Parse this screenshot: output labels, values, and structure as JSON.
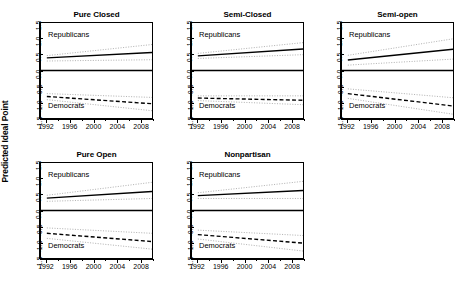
{
  "figure": {
    "ylabel": "Predicted Ideal Point",
    "annotation_republicans": "Republicans",
    "annotation_democrats": "Democrats"
  },
  "axes": {
    "ytick_labels": [
      "-1.5",
      "-1.0",
      "-0.5",
      "0.0",
      "0.5",
      "1.0",
      "1.5"
    ],
    "ytick_values": [
      -1.5,
      -1.0,
      -0.5,
      0.0,
      0.5,
      1.0,
      1.5
    ],
    "xtick_labels": [
      "1992",
      "1996",
      "2000",
      "2004",
      "2008"
    ],
    "xtick_values": [
      1992,
      1996,
      2000,
      2004,
      2008
    ],
    "xlim": [
      1991,
      2010
    ],
    "ylim": [
      -1.5,
      1.5
    ]
  },
  "colors": {
    "line": "#000000",
    "ci": "#b4b4b4",
    "zero_line": "#000000",
    "frame": "#000000",
    "background": "#ffffff"
  },
  "chart_data": {
    "type": "line",
    "title": "",
    "xlabel": "",
    "ylabel": "Predicted Ideal Point",
    "xlim": [
      1991,
      2010
    ],
    "ylim": [
      -1.5,
      1.5
    ],
    "grid": false,
    "legend_position": "none",
    "x": [
      1992,
      2010
    ],
    "panels": [
      {
        "title": "Pure Closed",
        "row": 0,
        "col": 0,
        "series": [
          {
            "name": "Republicans",
            "style": "solid",
            "values": [
              0.4,
              0.57
            ]
          },
          {
            "name": "Republicans CI upper",
            "style": "dotted",
            "values": [
              0.47,
              0.82
            ]
          },
          {
            "name": "Republicans CI lower",
            "style": "dotted",
            "values": [
              0.3,
              0.34
            ]
          },
          {
            "name": "Democrats",
            "style": "dashed",
            "values": [
              -0.82,
              -1.05
            ]
          },
          {
            "name": "Democrats CI upper",
            "style": "dotted",
            "values": [
              -0.73,
              -0.85
            ]
          },
          {
            "name": "Democrats CI lower",
            "style": "dotted",
            "values": [
              -0.92,
              -1.27
            ]
          }
        ]
      },
      {
        "title": "Semi-Closed",
        "row": 0,
        "col": 1,
        "series": [
          {
            "name": "Republicans",
            "style": "solid",
            "values": [
              0.46,
              0.68
            ]
          },
          {
            "name": "Republicans CI upper",
            "style": "dotted",
            "values": [
              0.54,
              0.88
            ]
          },
          {
            "name": "Republicans CI lower",
            "style": "dotted",
            "values": [
              0.38,
              0.5
            ]
          },
          {
            "name": "Democrats",
            "style": "dashed",
            "values": [
              -0.87,
              -0.94
            ]
          },
          {
            "name": "Democrats CI upper",
            "style": "dotted",
            "values": [
              -0.8,
              -0.8
            ]
          },
          {
            "name": "Democrats CI lower",
            "style": "dotted",
            "values": [
              -0.95,
              -1.08
            ]
          }
        ]
      },
      {
        "title": "Semi-open",
        "row": 0,
        "col": 2,
        "series": [
          {
            "name": "Republicans",
            "style": "solid",
            "values": [
              0.33,
              0.67
            ]
          },
          {
            "name": "Republicans CI upper",
            "style": "dotted",
            "values": [
              0.48,
              1.0
            ]
          },
          {
            "name": "Republicans CI lower",
            "style": "dotted",
            "values": [
              0.17,
              0.36
            ]
          },
          {
            "name": "Democrats",
            "style": "dashed",
            "values": [
              -0.73,
              -1.12
            ]
          },
          {
            "name": "Democrats CI upper",
            "style": "dotted",
            "values": [
              -0.58,
              -0.86
            ]
          },
          {
            "name": "Democrats CI lower",
            "style": "dotted",
            "values": [
              -0.88,
              -1.38
            ]
          }
        ]
      },
      {
        "title": "Pure Open",
        "row": 1,
        "col": 0,
        "series": [
          {
            "name": "Republicans",
            "style": "solid",
            "values": [
              0.39,
              0.6
            ]
          },
          {
            "name": "Republicans CI upper",
            "style": "dotted",
            "values": [
              0.48,
              0.89
            ]
          },
          {
            "name": "Republicans CI lower",
            "style": "dotted",
            "values": [
              0.29,
              0.38
            ]
          },
          {
            "name": "Democrats",
            "style": "dashed",
            "values": [
              -0.72,
              -0.98
            ]
          },
          {
            "name": "Democrats CI upper",
            "style": "dotted",
            "values": [
              -0.55,
              -0.72
            ]
          },
          {
            "name": "Democrats CI lower",
            "style": "dotted",
            "values": [
              -0.88,
              -1.22
            ]
          }
        ]
      },
      {
        "title": "Nonpartisan",
        "row": 1,
        "col": 1,
        "series": [
          {
            "name": "Republicans",
            "style": "solid",
            "values": [
              0.47,
              0.63
            ]
          },
          {
            "name": "Republicans CI upper",
            "style": "dotted",
            "values": [
              0.56,
              0.92
            ]
          },
          {
            "name": "Republicans CI lower",
            "style": "dotted",
            "values": [
              0.38,
              0.38
            ]
          },
          {
            "name": "Democrats",
            "style": "dashed",
            "values": [
              -0.76,
              -1.03
            ]
          },
          {
            "name": "Democrats CI upper",
            "style": "dotted",
            "values": [
              -0.62,
              -0.79
            ]
          },
          {
            "name": "Democrats CI lower",
            "style": "dotted",
            "values": [
              -0.9,
              -1.28
            ]
          }
        ]
      }
    ]
  }
}
